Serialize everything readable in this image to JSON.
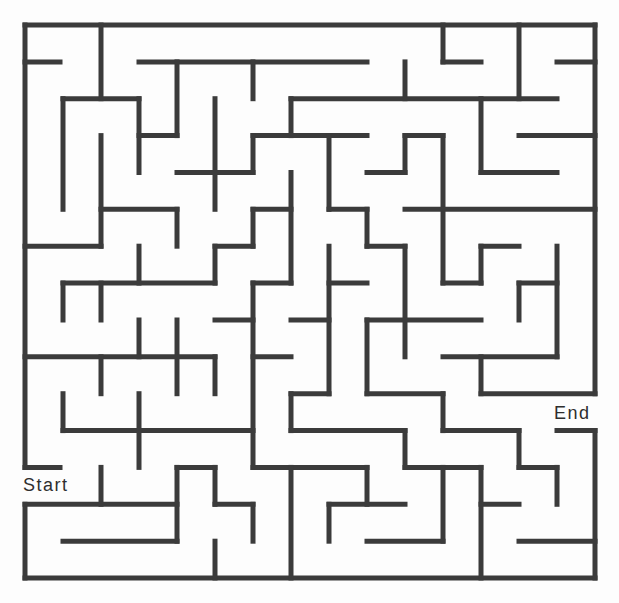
{
  "maze": {
    "size": {
      "cols": 15,
      "rows": 15
    },
    "origin_px": {
      "x": 25,
      "y": 25
    },
    "cell_px": {
      "w": 38,
      "h": 36.87
    },
    "wall_color": "#3b3b3b",
    "background_color": "#ffffff",
    "labels": {
      "start": "Start",
      "end": "End"
    },
    "entrance": {
      "side": "left",
      "row": 12
    },
    "exit": {
      "side": "right",
      "row": 10
    },
    "walls": [
      [
        0,
        0,
        15,
        0
      ],
      [
        0,
        0,
        0,
        12
      ],
      [
        0,
        13,
        0,
        15
      ],
      [
        0,
        15,
        15,
        15
      ],
      [
        15,
        0,
        15,
        10
      ],
      [
        15,
        11,
        15,
        15
      ],
      [
        0,
        1,
        0.92,
        1
      ],
      [
        3,
        1,
        9,
        1
      ],
      [
        11,
        1,
        12,
        1
      ],
      [
        14,
        1,
        15,
        1
      ],
      [
        2,
        0,
        2,
        2
      ],
      [
        6,
        1,
        6,
        2
      ],
      [
        10,
        1,
        10,
        2
      ],
      [
        11,
        0,
        11,
        1
      ],
      [
        13,
        0,
        13,
        2
      ],
      [
        1,
        2,
        3,
        2
      ],
      [
        7,
        2,
        14,
        2
      ],
      [
        1,
        2,
        1,
        5
      ],
      [
        3,
        2,
        3,
        4
      ],
      [
        4,
        1,
        4,
        3
      ],
      [
        5,
        2,
        5,
        5
      ],
      [
        7,
        2,
        7,
        3
      ],
      [
        12,
        2,
        12,
        4
      ],
      [
        3,
        3,
        4,
        3
      ],
      [
        6,
        3,
        9,
        3
      ],
      [
        10,
        3,
        11,
        3
      ],
      [
        13,
        3,
        15,
        3
      ],
      [
        2,
        3,
        2,
        6
      ],
      [
        6,
        3,
        6,
        4
      ],
      [
        8,
        3,
        8,
        5
      ],
      [
        10,
        3,
        10,
        4
      ],
      [
        11,
        3,
        11,
        7
      ],
      [
        4,
        4,
        6,
        4
      ],
      [
        9,
        4,
        10,
        4
      ],
      [
        12,
        4,
        14,
        4
      ],
      [
        7,
        4,
        7,
        7
      ],
      [
        2,
        5,
        4,
        5
      ],
      [
        6,
        5,
        7,
        5
      ],
      [
        8,
        5,
        9,
        5
      ],
      [
        10,
        5,
        15,
        5
      ],
      [
        4,
        5,
        4,
        6
      ],
      [
        6,
        5,
        6,
        6
      ],
      [
        9,
        5,
        9,
        6
      ],
      [
        0,
        6,
        2,
        6
      ],
      [
        5,
        6,
        6,
        6
      ],
      [
        9,
        6,
        10,
        6
      ],
      [
        12,
        6,
        13,
        6
      ],
      [
        3,
        6,
        3,
        7
      ],
      [
        5,
        6,
        5,
        7
      ],
      [
        8,
        6,
        8,
        10
      ],
      [
        10,
        6,
        10,
        9
      ],
      [
        12,
        6,
        12,
        7
      ],
      [
        14,
        6,
        14,
        9
      ],
      [
        1,
        7,
        5,
        7
      ],
      [
        6,
        7,
        7,
        7
      ],
      [
        8,
        7,
        9,
        7
      ],
      [
        11,
        7,
        12,
        7
      ],
      [
        13,
        7,
        14,
        7
      ],
      [
        1,
        7,
        1,
        8
      ],
      [
        2,
        7,
        2,
        8
      ],
      [
        6,
        7,
        6,
        12
      ],
      [
        13,
        7,
        13,
        8
      ],
      [
        5,
        8,
        6,
        8
      ],
      [
        7,
        8,
        8,
        8
      ],
      [
        9,
        8,
        12,
        8
      ],
      [
        3,
        8,
        3,
        9
      ],
      [
        4,
        8,
        4,
        10
      ],
      [
        9,
        8,
        9,
        10
      ],
      [
        0,
        9,
        5,
        9
      ],
      [
        6,
        9,
        7,
        9
      ],
      [
        11,
        9,
        14,
        9
      ],
      [
        2,
        9,
        2,
        10
      ],
      [
        5,
        9,
        5,
        10
      ],
      [
        12,
        9,
        12,
        10
      ],
      [
        7,
        10,
        8,
        10
      ],
      [
        9,
        10,
        11,
        10
      ],
      [
        12,
        10,
        15,
        10
      ],
      [
        1,
        10,
        1,
        11
      ],
      [
        3,
        10,
        3,
        12
      ],
      [
        7,
        10,
        7,
        11
      ],
      [
        11,
        10,
        11,
        11
      ],
      [
        1,
        11,
        6,
        11
      ],
      [
        7,
        11,
        10,
        11
      ],
      [
        11,
        11,
        13,
        11
      ],
      [
        14,
        11,
        15,
        11
      ],
      [
        10,
        11,
        10,
        12
      ],
      [
        13,
        11,
        13,
        12
      ],
      [
        0,
        12,
        0.92,
        12
      ],
      [
        4,
        12,
        5,
        12
      ],
      [
        6,
        12,
        9,
        12
      ],
      [
        10,
        12,
        12,
        12
      ],
      [
        13,
        12,
        14,
        12
      ],
      [
        2,
        12,
        2,
        13
      ],
      [
        4,
        12,
        4,
        14
      ],
      [
        5,
        12,
        5,
        13
      ],
      [
        7,
        12,
        7,
        15
      ],
      [
        9,
        12,
        9,
        13
      ],
      [
        11,
        12,
        11,
        14
      ],
      [
        12,
        12,
        12,
        15
      ],
      [
        14,
        12,
        14,
        13
      ],
      [
        0,
        13,
        4,
        13
      ],
      [
        5,
        13,
        6,
        13
      ],
      [
        8,
        13,
        10,
        13
      ],
      [
        12,
        13,
        13,
        13
      ],
      [
        6,
        13,
        6,
        14
      ],
      [
        8,
        13,
        8,
        14
      ],
      [
        1,
        14,
        4,
        14
      ],
      [
        9,
        14,
        11,
        14
      ],
      [
        13,
        14,
        15,
        14
      ],
      [
        5,
        14,
        5,
        15
      ]
    ]
  }
}
